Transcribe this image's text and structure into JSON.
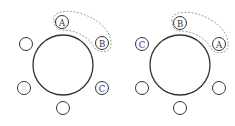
{
  "diagrams": [
    {
      "name": "left-arrangement",
      "table": {
        "cx": 63,
        "cy": 65,
        "r": 30
      },
      "seats": [
        {
          "cx": 62,
          "cy": 22,
          "label": "A"
        },
        {
          "cx": 102,
          "cy": 43,
          "label": "B"
        },
        {
          "cx": 102,
          "cy": 88,
          "label": "C"
        },
        {
          "cx": 63,
          "cy": 108,
          "label": ""
        },
        {
          "cx": 24,
          "cy": 88,
          "label": ""
        },
        {
          "cx": 26,
          "cy": 44,
          "label": ""
        }
      ],
      "grouped": [
        "A",
        "B"
      ]
    },
    {
      "name": "right-arrangement",
      "table": {
        "cx": 180,
        "cy": 65,
        "r": 30
      },
      "seats": [
        {
          "cx": 180,
          "cy": 23,
          "label": "B"
        },
        {
          "cx": 219,
          "cy": 44,
          "label": "A"
        },
        {
          "cx": 219,
          "cy": 88,
          "label": ""
        },
        {
          "cx": 180,
          "cy": 108,
          "label": ""
        },
        {
          "cx": 142,
          "cy": 88,
          "label": ""
        },
        {
          "cx": 142,
          "cy": 44,
          "label": "C"
        }
      ],
      "grouped": [
        "B",
        "A"
      ]
    }
  ],
  "seat_radius": 6.5,
  "labels": {
    "left": {
      "a": "A",
      "b": "B",
      "c": "C"
    },
    "right": {
      "a": "A",
      "b": "B",
      "c": "C"
    }
  }
}
